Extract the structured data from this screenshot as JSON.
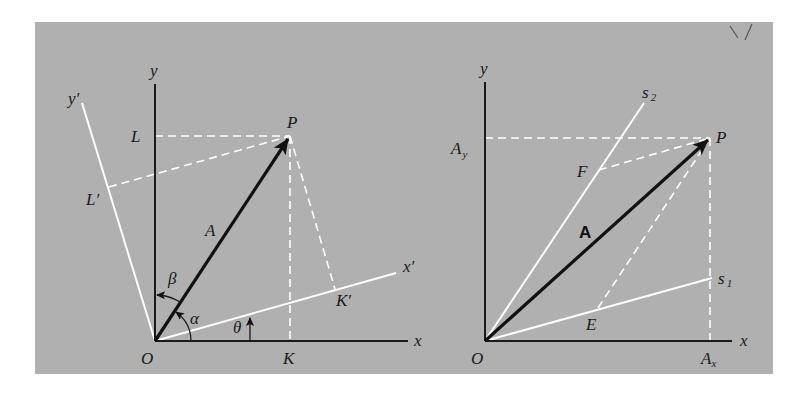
{
  "figure": {
    "background_color": "#b0b0b0",
    "page_color": "#ffffff",
    "axis_color": "#1a1a1a",
    "projection_color": "#ffffff"
  },
  "left_diagram": {
    "labels": {
      "y_axis": "y",
      "y_prime_axis": "y′",
      "x_axis": "x",
      "x_prime_axis": "x′",
      "origin": "O",
      "point_P": "P",
      "point_L": "L",
      "point_L_prime": "L′",
      "point_K": "K",
      "point_K_prime": "K′",
      "vector": "A",
      "angle_alpha": "α",
      "angle_beta": "β",
      "angle_theta": "θ"
    }
  },
  "right_diagram": {
    "labels": {
      "y_axis": "y",
      "x_axis": "x",
      "origin": "O",
      "point_P": "P",
      "s1_axis": "s",
      "s1_sub": "1",
      "s2_axis": "s",
      "s2_sub": "2",
      "point_E": "E",
      "point_F": "F",
      "vector": "A",
      "Ay_main": "A",
      "Ay_sub": "y",
      "Ax_main": "A",
      "Ax_sub": "x"
    }
  }
}
